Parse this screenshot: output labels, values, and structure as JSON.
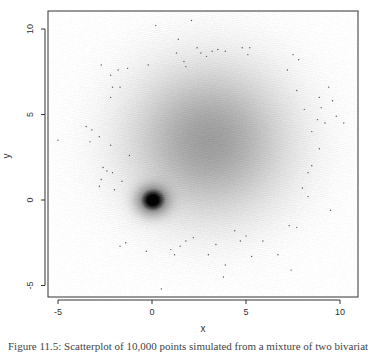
{
  "chart_data": {
    "type": "scatter",
    "subtype": "smoothed-density-scatter",
    "title": "",
    "xlabel": "x",
    "ylabel": "y",
    "xlim": [
      -5.6,
      10.9
    ],
    "ylim": [
      -5.7,
      11.1
    ],
    "xticks": [
      -5,
      0,
      5,
      10
    ],
    "yticks": [
      -5,
      0,
      5,
      10
    ],
    "xtick_labels": [
      "-5",
      "0",
      "5",
      "10"
    ],
    "ytick_labels": [
      "-5",
      "0",
      "5",
      "10"
    ],
    "grid": false,
    "legend": null,
    "density_components": [
      {
        "name": "diffuse cloud",
        "center": [
          3.0,
          3.5
        ],
        "sd": [
          2.6,
          2.7
        ],
        "weight": 0.55
      },
      {
        "name": "dense cluster",
        "center": [
          0.0,
          0.0
        ],
        "sd": [
          0.55,
          0.55
        ],
        "weight": 1.0
      }
    ],
    "outlier_points": [
      [
        0.2,
        10.2
      ],
      [
        2.1,
        10.5
      ],
      [
        1.4,
        9.4
      ],
      [
        2.4,
        8.9
      ],
      [
        1.3,
        8.6
      ],
      [
        2.6,
        8.6
      ],
      [
        3.2,
        8.7
      ],
      [
        3.5,
        8.8
      ],
      [
        3.9,
        8.7
      ],
      [
        2.9,
        8.4
      ],
      [
        4.8,
        8.9
      ],
      [
        5.2,
        8.9
      ],
      [
        5.1,
        8.5
      ],
      [
        1.7,
        8.1
      ],
      [
        1.8,
        7.8
      ],
      [
        -2.7,
        7.9
      ],
      [
        -1.8,
        7.6
      ],
      [
        -1.3,
        7.7
      ],
      [
        -0.2,
        7.9
      ],
      [
        7.5,
        8.5
      ],
      [
        7.8,
        8.2
      ],
      [
        7.2,
        7.6
      ],
      [
        -2.2,
        7.3
      ],
      [
        -2.1,
        6.6
      ],
      [
        -1.7,
        6.6
      ],
      [
        -2.2,
        6.0
      ],
      [
        -5.0,
        3.5
      ],
      [
        -3.5,
        4.3
      ],
      [
        -3.2,
        4.1
      ],
      [
        -2.8,
        3.7
      ],
      [
        -2.2,
        3.2
      ],
      [
        -3.3,
        3.4
      ],
      [
        -2.6,
        1.9
      ],
      [
        -2.4,
        1.7
      ],
      [
        -2.1,
        1.6
      ],
      [
        -2.7,
        1.2
      ],
      [
        -1.6,
        1.1
      ],
      [
        -2.8,
        0.8
      ],
      [
        -2.0,
        0.6
      ],
      [
        -1.2,
        2.6
      ],
      [
        9.4,
        6.6
      ],
      [
        9.6,
        5.8
      ],
      [
        8.9,
        6.0
      ],
      [
        7.7,
        6.4
      ],
      [
        8.1,
        5.3
      ],
      [
        9.0,
        5.4
      ],
      [
        8.8,
        4.7
      ],
      [
        9.2,
        4.5
      ],
      [
        9.8,
        4.9
      ],
      [
        8.5,
        4.0
      ],
      [
        10.2,
        4.5
      ],
      [
        8.9,
        3.0
      ],
      [
        8.5,
        2.0
      ],
      [
        8.3,
        1.6
      ],
      [
        8.0,
        0.7
      ],
      [
        8.3,
        0.2
      ],
      [
        9.5,
        -0.6
      ],
      [
        -1.7,
        -2.7
      ],
      [
        -1.4,
        -2.5
      ],
      [
        -0.3,
        -3.0
      ],
      [
        1.8,
        -2.4
      ],
      [
        2.2,
        -2.2
      ],
      [
        1.0,
        -2.9
      ],
      [
        1.2,
        -3.2
      ],
      [
        1.5,
        -2.7
      ],
      [
        3.0,
        -3.2
      ],
      [
        3.4,
        -2.6
      ],
      [
        3.9,
        -3.8
      ],
      [
        4.7,
        -2.4
      ],
      [
        5.3,
        -3.3
      ],
      [
        5.9,
        -2.4
      ],
      [
        6.7,
        -3.2
      ],
      [
        7.3,
        -1.5
      ],
      [
        7.7,
        -1.6
      ],
      [
        7.4,
        -4.1
      ],
      [
        3.8,
        -4.5
      ],
      [
        0.5,
        -5.2
      ],
      [
        5.0,
        -2.1
      ],
      [
        4.4,
        -1.8
      ]
    ],
    "colors": {
      "density_max": "#000000",
      "density_min": "#ffffff",
      "points": "#555555",
      "axis": "#333333"
    }
  },
  "plot": {
    "box": {
      "left": 48,
      "top": 11,
      "right": 358,
      "bottom": 297
    },
    "x_pixel_map": {
      "origin_px": 152,
      "px_per_unit": 18.8
    },
    "y_pixel_map": {
      "origin_px": 200,
      "px_per_unit": 17.1
    }
  },
  "caption": "Figure 11.5: Scatterplot of 10,000 points simulated from a mixture of two bivariate normals (smoothed density)"
}
